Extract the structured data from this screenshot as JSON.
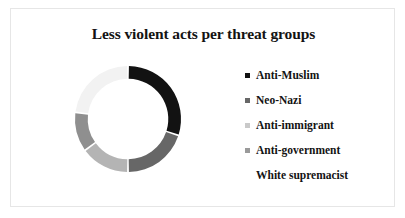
{
  "chart_data": {
    "type": "pie",
    "variant": "donut",
    "title": "Less violent acts per threat groups",
    "xlabel": "",
    "ylabel": "",
    "legend_position": "right",
    "grid": false,
    "categories": [
      "Anti-Muslim",
      "Neo-Nazi",
      "Anti-immigrant",
      "Anti-government",
      "White supremacist"
    ],
    "values": [
      30,
      20,
      15,
      12,
      23
    ],
    "colors": [
      "#121212",
      "#676767",
      "#b4b4b4",
      "#8f8f8f",
      "#f2f2f2"
    ],
    "start_angle_deg": 0,
    "inner_radius_ratio": 0.76,
    "slice_gap_deg": 2
  },
  "slide": {
    "title": "Less violent acts per threat groups",
    "background": "#ffffff",
    "border_color": "#e6e6e6",
    "title_color": "#131313"
  },
  "legend": {
    "items": [
      {
        "label": "Anti-Muslim",
        "color": "#121212"
      },
      {
        "label": "Neo-Nazi",
        "color": "#676767"
      },
      {
        "label": "Anti-immigrant",
        "color": "#c9c9c9"
      },
      {
        "label": "Anti-government",
        "color": "#9a9a9a"
      },
      {
        "label": "White supremacist",
        "color": "#ffffff"
      }
    ]
  }
}
